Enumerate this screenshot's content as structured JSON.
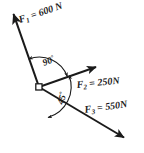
{
  "figure": {
    "background_color": "#ffffff",
    "stroke_color": "#1a1a1a",
    "origin": {
      "x": 39,
      "y": 87
    },
    "origin_marker": "open-square"
  },
  "vectors": [
    {
      "id": "F1",
      "symbol": "F",
      "subscript": "1",
      "separator": " = ",
      "magnitude": "600",
      "unit": "N",
      "label": "F1 = 600 N",
      "tail": {
        "x": 39,
        "y": 87
      },
      "tip": {
        "x": 12,
        "y": 10
      },
      "label_pos": {
        "x": 20,
        "y": 23
      },
      "label_rotation": -19,
      "arrow": "single-head-at-tip"
    },
    {
      "id": "F2",
      "symbol": "F",
      "subscript": "2",
      "separator": " = ",
      "magnitude": "250",
      "unit": "N",
      "label": "F2 = 250 N",
      "tail": {
        "x": 39,
        "y": 87
      },
      "tip": {
        "x": 99,
        "y": 66
      },
      "label_pos": {
        "x": 77,
        "y": 88
      },
      "label_rotation": -6,
      "arrow": "single-head-at-tip"
    },
    {
      "id": "F3",
      "symbol": "F",
      "subscript": "3",
      "separator": " = ",
      "magnitude": "550",
      "unit": "N",
      "label": "F3 = 550 N",
      "tail": {
        "x": 39,
        "y": 87
      },
      "tip": {
        "x": 128,
        "y": 140
      },
      "label_pos": {
        "x": 85,
        "y": 113
      },
      "label_rotation": -8,
      "arrow": "single-head-at-tip"
    }
  ],
  "angles": [
    {
      "id": "angle-90",
      "value": "90",
      "degree_symbol": "°",
      "label": "90°",
      "between": [
        "F1",
        "F2"
      ],
      "label_pos": {
        "x": 45,
        "y": 65
      },
      "label_rotation": -22,
      "arc": "double-headed",
      "arc_radius": 30
    },
    {
      "id": "angle-45",
      "value": "45",
      "degree_symbol": "°",
      "label": "45°",
      "between": [
        "F2",
        "F3"
      ],
      "label_pos": {
        "x": 63,
        "y": 104
      },
      "label_rotation": -73,
      "arc": "double-headed",
      "arc_radius": 32
    }
  ]
}
